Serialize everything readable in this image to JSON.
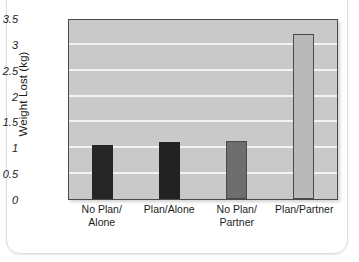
{
  "chart_data": {
    "type": "bar",
    "title": "",
    "xlabel": "",
    "ylabel": "Weight Lost (kg)",
    "categories": [
      "No Plan/\nAlone",
      "Plan/Alone",
      "No Plan/\nPartner",
      "Plan/Partner"
    ],
    "category_lines": [
      [
        "No Plan/",
        "Alone"
      ],
      [
        "Plan/Alone",
        ""
      ],
      [
        "No Plan/",
        "Partner"
      ],
      [
        "Plan/Partner",
        ""
      ]
    ],
    "values": [
      1.05,
      1.1,
      1.12,
      3.19
    ],
    "ylim": [
      0,
      3.5
    ],
    "yticks": [
      0,
      0.5,
      1,
      1.5,
      2,
      2.5,
      3,
      3.5
    ],
    "ytick_labels": [
      "0",
      "0.5",
      "1",
      "1.5",
      "2",
      "2.5",
      "3",
      "3.5"
    ],
    "grid": true,
    "legend": "none",
    "bar_colors": [
      "#262626",
      "#222222",
      "#6e6e6e",
      "#b9b9b9"
    ],
    "bar_border_colors": [
      "#262626",
      "#222222",
      "#4a4a4a",
      "#4a4a4a"
    ],
    "plot_background": "#c9c9c9",
    "gridline_color": "#f2f2f2",
    "axis_color": "#4a4a4a"
  }
}
